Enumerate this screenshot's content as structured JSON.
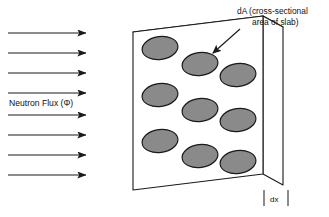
{
  "figure": {
    "type": "physics-diagram",
    "background_color": "#ffffff",
    "width": 329,
    "height": 217
  },
  "flux": {
    "label": "Neutron Flux (Φ)",
    "arrow_count": 8,
    "arrow_color": "#1a1a1a",
    "direction": "left-to-right",
    "arrow_y_positions": [
      33,
      53,
      73,
      93,
      115,
      135,
      155,
      175
    ],
    "arrow_x_start": 8,
    "arrow_x_end": 88,
    "label_x": 9,
    "label_y": 106
  },
  "annotations": {
    "area": {
      "line1": "dA (cross-sectional",
      "line2": "area of slab)",
      "line1_x": 237,
      "line1_y": 14,
      "line2_x": 252,
      "line2_y": 25,
      "leader_from_x": 240,
      "leader_from_y": 29,
      "leader_to_x": 211,
      "leader_to_y": 55
    },
    "thickness": {
      "label": "dx",
      "label_x": 272,
      "label_y": 201,
      "tick_left_x": 264,
      "tick_right_x": 288,
      "tick_top_y": 190,
      "tick_bottom_y": 206
    }
  },
  "slab": {
    "front_face": {
      "color": "#ffffff",
      "stroke": "#1a1a1a",
      "points": "133,32 263,16 263,174 133,190"
    },
    "top_face": {
      "color": "#ffffff",
      "stroke": "#1a1a1a",
      "points": "133,32 263,16 283,27 153,43"
    },
    "side_face": {
      "color": "#ffffff",
      "stroke": "#1a1a1a",
      "points": "263,16 283,27 283,185 263,174"
    },
    "stroke_width": 1.1
  },
  "nuclei": {
    "count": 9,
    "fill_color": "#8a8a8a",
    "stroke_color": "#1a1a1a",
    "shape": "ellipse",
    "rx": 18,
    "ry": 11.5,
    "rotation_deg": -8,
    "items": [
      {
        "cx": 160,
        "cy": 48
      },
      {
        "cx": 160,
        "cy": 95
      },
      {
        "cx": 160,
        "cy": 141
      },
      {
        "cx": 200,
        "cy": 64
      },
      {
        "cx": 200,
        "cy": 110
      },
      {
        "cx": 200,
        "cy": 156
      },
      {
        "cx": 238,
        "cy": 75
      },
      {
        "cx": 238,
        "cy": 120
      },
      {
        "cx": 238,
        "cy": 162
      }
    ]
  }
}
